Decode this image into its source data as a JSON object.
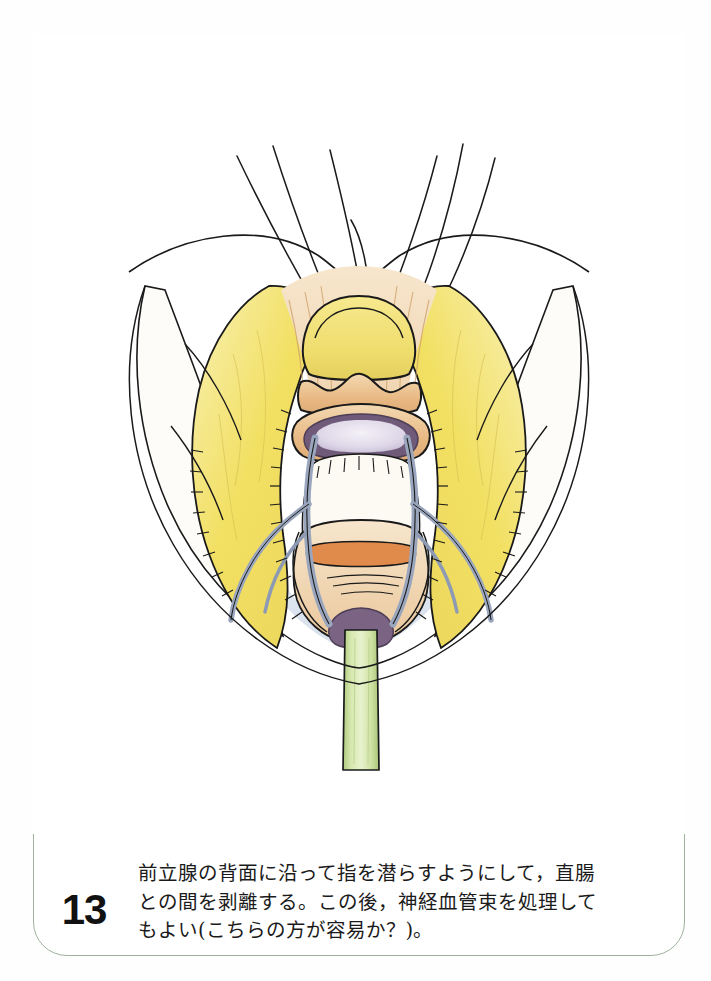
{
  "page": {
    "background_color": "#ffffff",
    "card_border_color": "#9db39d"
  },
  "figure": {
    "number": "13",
    "caption_line_1": "前立腺の背面に沿って指を潜らすようにして，直腸",
    "caption_line_2": "との間を剥離する。この後，神経血管束を処理して",
    "caption_line_3": "もよい(こちらの方が容易か？)。",
    "caption_full": "前立腺の背面に沿って指を潜らすようにして，直腸\nとの間を剥離する。この後，神経血管束を処理して\nもよい(こちらの方が容易か？)。",
    "title_alt": "前立腺背面の剥離(図13)",
    "illustration": {
      "type": "hand-drawn surgical anatomy diagram",
      "view": "retropubic perineal operative field, midline sagittal-frontal view",
      "colors": {
        "fat_yellow": "#f2e063",
        "fat_yellow_light": "#f7ec9a",
        "tissue_tan": "#e8b882",
        "tissue_tan_light": "#f2d3a8",
        "muscle_orange": "#e08a4c",
        "vessel_gray_blue": "#9aa6bd",
        "urethra_purple": "#7b6384",
        "lumen_lavender": "#ded7e8",
        "catheter_green": "#c5dc92",
        "catheter_green_dark": "#a8c477",
        "ink": "#1a1a1a",
        "pale_blue_shadow": "#dfe6ef"
      },
      "labels": {
        "seminal_vesicle": "精嚢",
        "bladder_neck": "膀胱頸部",
        "prostate": "前立腺",
        "neurovascular_bundle": "神経血管束",
        "levator_ani_fat": "脂肪組織",
        "urethral_catheter": "尿道カテーテル",
        "sutures": "支持糸"
      },
      "element_counts": {
        "suture_threads": 6,
        "neurovascular_bundles": 2,
        "fat_pads": 2
      }
    }
  }
}
